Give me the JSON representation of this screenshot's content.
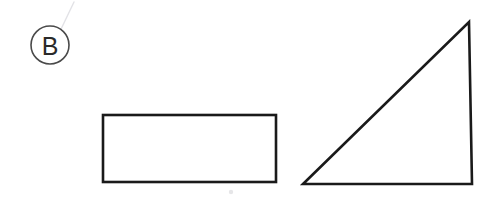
{
  "figure": {
    "label": "B",
    "label_kind": "circled-letter",
    "background_color": "#ffffff",
    "stroke_color": "#1a1a1a",
    "ring_stroke_color": "#4a4a4a",
    "glyph_color": "#2a2a2a",
    "artifact_color": "#e2e2e6",
    "canvas": {
      "width": 496,
      "height": 202
    },
    "label_marker": {
      "center_x": 50,
      "center_y": 45,
      "radius": 19,
      "ring_width": 1.6
    },
    "shapes": [
      {
        "name": "rectangle",
        "kind": "rectangle",
        "x": 103,
        "y": 115,
        "width": 173,
        "height": 67,
        "stroke_width": 2.6,
        "fill": "none"
      },
      {
        "name": "right-triangle",
        "kind": "triangle",
        "points": "303,184 472,184 469,22",
        "right_angle_at": "bottom-right",
        "base_width": 169,
        "height": 162,
        "stroke_width": 2.6,
        "fill": "none"
      }
    ],
    "artifacts": [
      {
        "name": "crease-streak",
        "path": "M 74 2 L 52 48"
      },
      {
        "name": "speck",
        "cx": 231,
        "cy": 192,
        "r": 2.2
      }
    ]
  }
}
